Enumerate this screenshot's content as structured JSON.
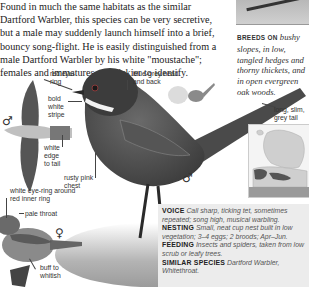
{
  "intro_text": "Found in much the same habitats as the similar Dartford Warbler, this species can be very secretive, but a male may suddenly launch himself into a brief, bouncy song-flight. He is easily distinguished from a male Dartford Warbler by his white \"moustache\"; females and immatures are trickier to identify.",
  "breeds_on": {
    "label": "BREEDS ON",
    "text": "bushy slopes, in low, tangled hedges and thorny thickets, and in open evergreen oak woods."
  },
  "labels": {
    "red_eye_ring": "red eye-ring",
    "blue_grey_head": "blue-grey head and back",
    "bold_white_stripe": "bold white stripe",
    "white_edge_tail": "white edge to tail",
    "rusty_pink_chest": "rusty pink chest",
    "long_slim_tail": "long, slim, grey tail",
    "white_eye_ring": "white eye-ring around red inner ring",
    "pale_throat": "pale throat",
    "buff_to_whitish": "buff to whitish"
  },
  "symbols": {
    "male": "♂",
    "female": "♀"
  },
  "info_box": {
    "voice_label": "VOICE",
    "voice_text": "Call sharp, ticking tet, sometimes repeated; song high, musical warbling.",
    "nesting_label": "NESTING",
    "nesting_text": "Small, neat cup nest built in low vegetation; 3–4 eggs; 2 broods; Apr–Jun.",
    "feeding_label": "FEEDING",
    "feeding_text": "Insects and spiders, taken from low scrub or leafy trees.",
    "similar_label": "SIMILAR SPECIES",
    "similar_text": "Dartford Warbler, Whitethroat."
  },
  "map": {
    "range_color": "#555555",
    "land_color": "#cfcfcf",
    "sea_color": "#f4f4f4"
  }
}
